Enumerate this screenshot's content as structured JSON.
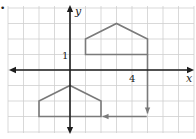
{
  "diagram": {
    "type": "coordinate-grid-transformation",
    "bullet": "•",
    "axes": {
      "x_label": "x",
      "y_label": "y",
      "tick_labels": [
        {
          "axis": "y",
          "value": 1,
          "text": "1"
        },
        {
          "axis": "x",
          "value": 4,
          "text": "4"
        }
      ]
    },
    "grid": {
      "x_range": [
        -4,
        8
      ],
      "y_range": [
        -4,
        4
      ],
      "unit_px": 15.5,
      "origin_px": [
        70,
        70
      ]
    },
    "shapes": [
      {
        "name": "original-pentagon",
        "vertices": [
          [
            1,
            1
          ],
          [
            1,
            2
          ],
          [
            3,
            3
          ],
          [
            5,
            2
          ],
          [
            5,
            1
          ]
        ]
      },
      {
        "name": "image-pentagon",
        "vertices": [
          [
            -2,
            -3
          ],
          [
            -2,
            -2
          ],
          [
            0,
            -1
          ],
          [
            2,
            -2
          ],
          [
            2,
            -3
          ]
        ]
      }
    ],
    "arrows": [
      {
        "name": "translate-down-arrow",
        "from": [
          5,
          1
        ],
        "to": [
          5,
          -2.8
        ]
      },
      {
        "name": "translate-left-arrow",
        "from": [
          4.95,
          -3
        ],
        "to": [
          2.1,
          -3
        ]
      }
    ],
    "colors": {
      "background": "#ffffff",
      "grid": "#cfcfcf",
      "axis": "#1e1e1e",
      "shape": "#7a7a7a",
      "text": "#222222"
    }
  }
}
